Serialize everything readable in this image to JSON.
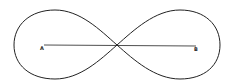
{
  "diagram": {
    "type": "lemniscate",
    "labels": {
      "left_point": "A",
      "right_point": "B"
    },
    "colors": {
      "stroke": "#222222",
      "background": "#ffffff"
    }
  }
}
